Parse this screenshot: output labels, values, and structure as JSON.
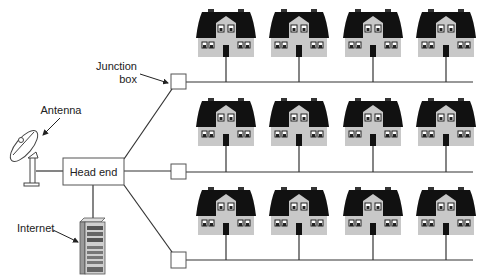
{
  "diagram": {
    "labels": {
      "junction_line1": "Junction",
      "junction_line2": "box",
      "antenna": "Antenna",
      "head_end": "Head end",
      "internet": "Internet"
    },
    "colors": {
      "line": "#333333",
      "roof": "#111111",
      "wall": "#c8c8c8",
      "gable": "#bdbdbd"
    },
    "rows": [
      {
        "cable_y": 82,
        "house_top": 9,
        "junction_box": {
          "x": 171,
          "y": 74
        }
      },
      {
        "cable_y": 172,
        "house_top": 98,
        "junction_box": {
          "x": 171,
          "y": 164
        }
      },
      {
        "cable_y": 260,
        "house_top": 187,
        "junction_box": {
          "x": 171,
          "y": 252
        }
      }
    ],
    "house_centers_x": [
      226,
      299,
      373,
      446
    ],
    "houses_per_row": 4,
    "row_count": 3
  }
}
